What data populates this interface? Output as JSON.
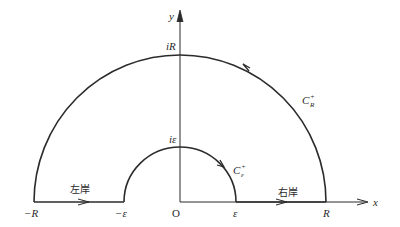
{
  "diagram": {
    "type": "contour-integration",
    "axes": {
      "x_label": "x",
      "y_label": "y",
      "origin_label": "O"
    },
    "x_axis_ticks": [
      {
        "label": "−R",
        "value": "-R"
      },
      {
        "label": "−ε",
        "value": "-epsilon"
      },
      {
        "label": "ε",
        "value": "epsilon"
      },
      {
        "label": "R",
        "value": "R"
      }
    ],
    "y_axis_ticks": [
      {
        "label": "iR",
        "value": "iR"
      },
      {
        "label": "iε",
        "value": "i*epsilon"
      }
    ],
    "curves": {
      "large_arc": {
        "label": "C",
        "sup": "+",
        "sub": "R",
        "direction": "counterclockwise"
      },
      "small_arc": {
        "label": "C",
        "sup": "+",
        "sub": "ε",
        "direction": "clockwise"
      }
    },
    "segments": {
      "left_bank": {
        "label": "左岸",
        "from": "-R",
        "to": "-epsilon"
      },
      "right_bank": {
        "label": "右岸",
        "from": "epsilon",
        "to": "R"
      }
    },
    "colors": {
      "stroke": "#2b2b2b",
      "background": "#ffffff"
    }
  }
}
